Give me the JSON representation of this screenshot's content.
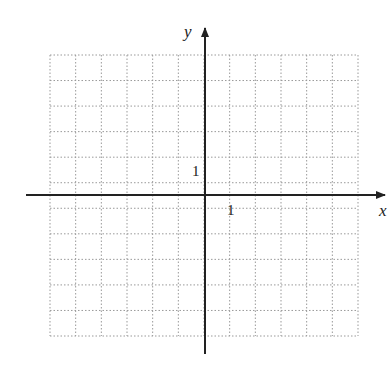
{
  "diagram": {
    "type": "coordinate-grid",
    "axes": {
      "x_label": "x",
      "y_label": "y",
      "x_tick_label": "1",
      "y_tick_label": "1"
    },
    "grid": {
      "columns": 12,
      "rows": 11,
      "line_style": "dotted",
      "line_color": "#999999"
    },
    "axis_color": "#222222"
  }
}
